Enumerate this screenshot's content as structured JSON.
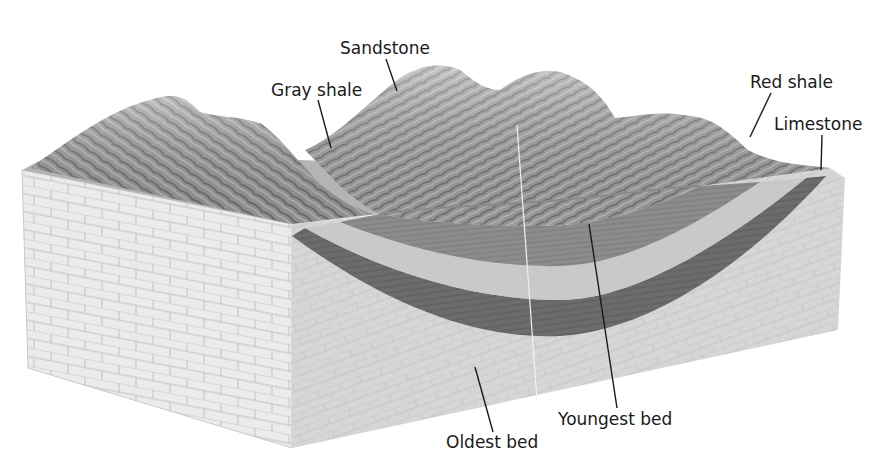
{
  "figure": {
    "type": "geologic block diagram"
  },
  "labels": {
    "sandstone": "Sandstone",
    "gray_shale": "Gray shale",
    "red_shale": "Red shale",
    "limestone": "Limestone",
    "youngest_bed": "Youngest bed",
    "oldest_bed": "Oldest bed"
  },
  "colors": {
    "background": "#ffffff",
    "front_face": "#e9e9e9",
    "brick_lines": "#b9b9b9",
    "oldest_bed": "#d8d8d8",
    "dark_band": "#6e6e6e",
    "light_band": "#c8c8c8",
    "youngest_core": "#8a8a8a",
    "terrain": "#9a9a9a",
    "leader_line": "#1a1a1a",
    "label_text": "#1a1a1a"
  }
}
